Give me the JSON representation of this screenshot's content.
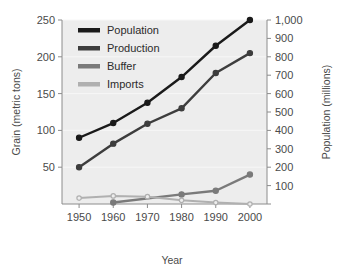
{
  "chart_data": {
    "type": "line",
    "title": "",
    "subtitle": "",
    "xlabel": "Year",
    "ylabel": "Grain (metric tons)",
    "y2label": "Population (millions)",
    "x": [
      1950,
      1960,
      1970,
      1980,
      1990,
      2000
    ],
    "xticklabels": [
      "1950",
      "1960",
      "1970",
      "1980",
      "1990",
      "2000"
    ],
    "xlim": [
      1945,
      2005
    ],
    "ylim": [
      0,
      250
    ],
    "yticks": [
      50,
      100,
      150,
      200,
      250
    ],
    "yticklabels": [
      "50",
      "100",
      "150",
      "200",
      "250"
    ],
    "y2lim": [
      0,
      1000
    ],
    "y2ticks": [
      0,
      100,
      200,
      300,
      400,
      500,
      600,
      700,
      800,
      900,
      1000
    ],
    "y2ticklabels": [
      "",
      "100",
      "200",
      "300",
      "400",
      "500",
      "600",
      "700",
      "800",
      "900",
      "1,000"
    ],
    "grid": true,
    "legend_position": "upper left",
    "series": [
      {
        "name": "Population",
        "axis": "right",
        "color": "#1a1a1a",
        "x": [
          1950,
          1960,
          1970,
          1980,
          1990,
          2000
        ],
        "values": [
          360,
          440,
          550,
          690,
          860,
          1000
        ],
        "values_left_axis": [
          90,
          110,
          138,
          172,
          215,
          250
        ]
      },
      {
        "name": "Production",
        "axis": "left",
        "color": "#3d3d3d",
        "x": [
          1950,
          1960,
          1970,
          1980,
          1990,
          2000
        ],
        "values": [
          50,
          82,
          109,
          130,
          178,
          205
        ]
      },
      {
        "name": "Buffer",
        "axis": "left",
        "color": "#7a7a7a",
        "x": [
          1960,
          1980,
          1990,
          2000
        ],
        "values": [
          2,
          13,
          18,
          40
        ]
      },
      {
        "name": "Imports",
        "axis": "left",
        "color": "#b0b0b0",
        "x": [
          1950,
          1960,
          1970,
          1980,
          1990,
          2000
        ],
        "values": [
          8,
          11,
          10,
          5,
          2,
          0
        ]
      }
    ]
  },
  "legend": {
    "items": [
      {
        "label": "Population",
        "color": "#1a1a1a"
      },
      {
        "label": "Production",
        "color": "#3d3d3d"
      },
      {
        "label": "Buffer",
        "color": "#7a7a7a"
      },
      {
        "label": "Imports",
        "color": "#b0b0b0"
      }
    ]
  },
  "axes": {
    "left_title": "Grain (metric tons)",
    "right_title": "Population (millions)",
    "bottom_title": "Year"
  },
  "colors": {
    "plot_background": "#ededed",
    "page_background": "#ffffff",
    "axis_line": "#8c8c8c",
    "gridline": "#f7f7f7",
    "text": "#4a4a4a"
  }
}
